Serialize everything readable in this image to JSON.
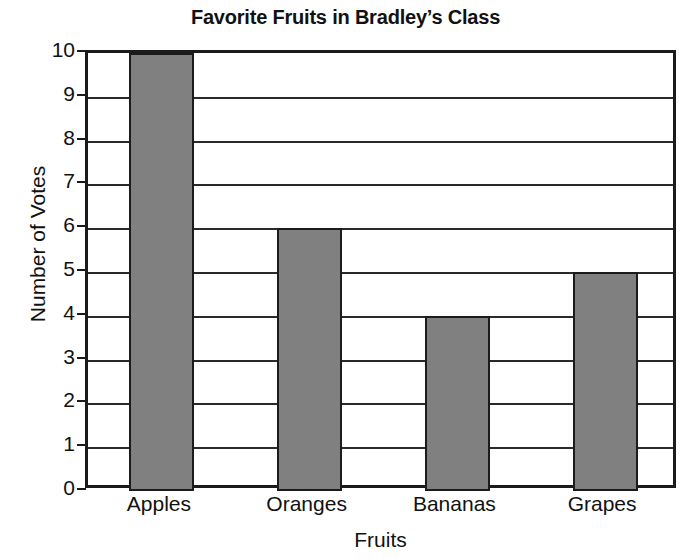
{
  "chart_data": {
    "type": "bar",
    "title": "Favorite Fruits in Bradley’s Class",
    "xlabel": "Fruits",
    "ylabel": "Number of Votes",
    "categories": [
      "Apples",
      "Oranges",
      "Bananas",
      "Grapes"
    ],
    "values": [
      10,
      6,
      4,
      5
    ],
    "ylim": [
      0,
      10
    ],
    "ytick_labels": [
      "10",
      "9",
      "8",
      "7",
      "6",
      "5",
      "4",
      "3",
      "2",
      "1",
      "0"
    ],
    "ytick_values": [
      10,
      9,
      8,
      7,
      6,
      5,
      4,
      3,
      2,
      1,
      0
    ],
    "grid": true,
    "grid_axis": "y",
    "legend": null,
    "bar_color": "#808080",
    "bar_edge_color": "#1b1b1b",
    "axis_color": "#1b1b1b",
    "background_color": "#ffffff"
  }
}
